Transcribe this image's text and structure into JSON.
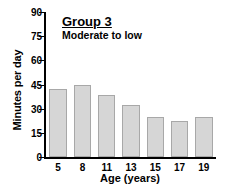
{
  "chart_data": {
    "type": "bar",
    "title": "Group 3",
    "subtitle": "Moderate to low",
    "xlabel": "Age (years)",
    "ylabel": "Minutes per day",
    "categories": [
      "5",
      "8",
      "11",
      "13",
      "15",
      "17",
      "19"
    ],
    "values": [
      42,
      45,
      38.5,
      32,
      25,
      22.5,
      25
    ],
    "ylim": [
      0,
      90
    ],
    "yticks": [
      0,
      15,
      30,
      45,
      60,
      75,
      90
    ],
    "ytick_labels": [
      "0",
      "15",
      "30",
      "45",
      "60",
      "75",
      "90"
    ],
    "grid": false,
    "legend": "none",
    "bar_fill_color": "#d6d6d6",
    "bar_border_color": "#a8a8a8",
    "axis_color": "#000000",
    "background_color": "#ffffff"
  }
}
